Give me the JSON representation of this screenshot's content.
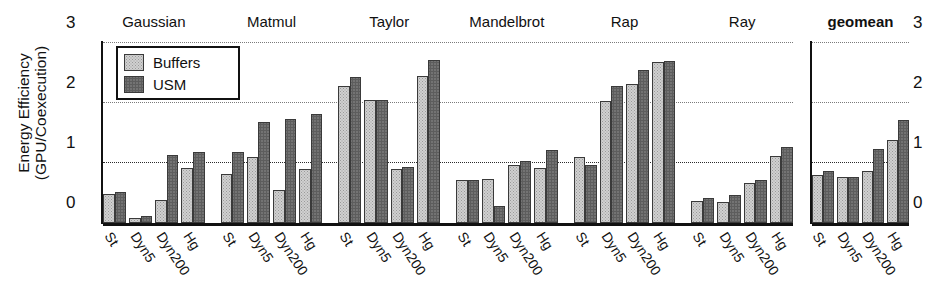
{
  "chart_data": {
    "type": "bar",
    "title": "",
    "xlabel": "",
    "ylabel": "Energy Efficiency (GPU/Coexecution)",
    "ylabel_lines": [
      "Energy Efficiency",
      "(GPU/Coexecution)"
    ],
    "ylim": [
      0,
      3
    ],
    "yticks": [
      0,
      1,
      2,
      3
    ],
    "ytick_labels": [
      "0",
      "1",
      "2",
      "3"
    ],
    "grid": "horizontal-dotted",
    "legend_position": "upper-left-inside",
    "categories": [
      "St",
      "Dyn5",
      "Dyn200",
      "Hg"
    ],
    "legend": [
      "Buffers",
      "USM"
    ],
    "groups": [
      {
        "name": "Gaussian",
        "series": [
          {
            "name": "Buffers",
            "values": [
              0.48,
              0.09,
              0.38,
              0.92
            ]
          },
          {
            "name": "USM",
            "values": [
              0.52,
              0.11,
              1.13,
              1.18
            ]
          }
        ]
      },
      {
        "name": "Matmul",
        "series": [
          {
            "name": "Buffers",
            "values": [
              0.82,
              1.1,
              0.55,
              0.9
            ]
          },
          {
            "name": "USM",
            "values": [
              1.18,
              1.68,
              1.74,
              1.82
            ]
          }
        ]
      },
      {
        "name": "Taylor",
        "series": [
          {
            "name": "Buffers",
            "values": [
              2.28,
              2.05,
              0.9,
              2.45
            ]
          },
          {
            "name": "USM",
            "values": [
              2.43,
              2.05,
              0.93,
              2.72
            ]
          }
        ]
      },
      {
        "name": "Mandelbrot",
        "series": [
          {
            "name": "Buffers",
            "values": [
              0.72,
              0.73,
              0.97,
              0.92
            ]
          },
          {
            "name": "USM",
            "values": [
              0.72,
              0.28,
              1.03,
              1.22
            ]
          }
        ]
      },
      {
        "name": "Rap",
        "series": [
          {
            "name": "Buffers",
            "values": [
              1.1,
              2.03,
              2.32,
              2.68
            ]
          },
          {
            "name": "USM",
            "values": [
              0.97,
              2.28,
              2.55,
              2.7
            ]
          }
        ]
      },
      {
        "name": "Ray",
        "series": [
          {
            "name": "Buffers",
            "values": [
              0.37,
              0.35,
              0.66,
              1.12
            ]
          },
          {
            "name": "USM",
            "values": [
              0.41,
              0.47,
              0.72,
              1.27
            ]
          }
        ]
      }
    ],
    "geomean": {
      "name": "geomean",
      "ylim": [
        0,
        3
      ],
      "yticks": [
        0,
        1,
        2,
        3
      ],
      "ytick_labels": [
        "0",
        "1",
        "2",
        "3"
      ],
      "categories": [
        "St",
        "Dyn5",
        "Dyn200",
        "Hg"
      ],
      "series": [
        {
          "name": "Buffers",
          "values": [
            0.8,
            0.76,
            0.86,
            1.38
          ]
        },
        {
          "name": "USM",
          "values": [
            0.86,
            0.77,
            1.24,
            1.72
          ]
        }
      ]
    }
  }
}
